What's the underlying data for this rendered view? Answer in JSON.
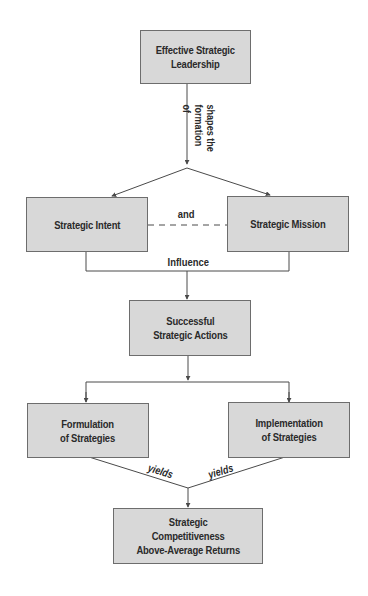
{
  "diagram": {
    "nodes": {
      "leadership": "Effective Strategic\nLeadership",
      "intent": "Strategic Intent",
      "mission": "Strategic Mission",
      "actions": "Successful\nStrategic Actions",
      "formulation": "Formulation\nof Strategies",
      "implementation": "Implementation\nof Strategies",
      "outcome": "Strategic\nCompetitiveness\nAbove-Average Returns"
    },
    "edge_labels": {
      "shapes": "shapes the\nformation of",
      "and": "and",
      "influence": "Influence",
      "yields_left": "yields",
      "yields_right": "yields"
    },
    "colors": {
      "box_fill": "#d8d8d8",
      "box_border": "#6d6d6d",
      "line": "#4a4a4a",
      "text": "#2a2a2a"
    }
  }
}
